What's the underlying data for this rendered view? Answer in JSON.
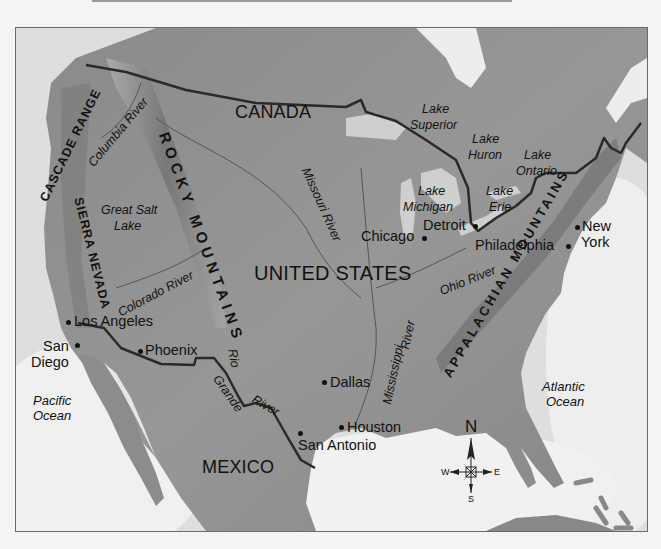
{
  "map": {
    "countries": {
      "canada": "CANADA",
      "united_states": "UNITED STATES",
      "mexico": "MEXICO"
    },
    "mountains": {
      "cascade": "CASCADE RANGE",
      "sierra": "SIERRA NEVADA",
      "rocky": "ROCKY MOUNTAINS",
      "appalachian": "APPALACHIAN MOUNTAINS"
    },
    "rivers": {
      "columbia": "Columbia River",
      "missouri": "Missouri River",
      "colorado": "Colorado River",
      "rio_grande_1": "Rio",
      "rio_grande_2": "Grande",
      "rio_grande_3": "River",
      "mississippi_1": "Mississippi",
      "mississippi_2": "River",
      "ohio": "Ohio River"
    },
    "lakes": {
      "great_salt_1": "Great Salt",
      "great_salt_2": "Lake",
      "superior_1": "Lake",
      "superior_2": "Superior",
      "huron_1": "Lake",
      "huron_2": "Huron",
      "ontario_1": "Lake",
      "ontario_2": "Ontario",
      "michigan_1": "Lake",
      "michigan_2": "Michigan",
      "erie_1": "Lake",
      "erie_2": "Erie"
    },
    "oceans": {
      "pacific_1": "Pacific",
      "pacific_2": "Ocean",
      "atlantic_1": "Atlantic",
      "atlantic_2": "Ocean"
    },
    "cities": {
      "los_angeles": "Los Angeles",
      "san_diego_1": "San",
      "san_diego_2": "Diego",
      "phoenix": "Phoenix",
      "dallas": "Dallas",
      "houston": "Houston",
      "san_antonio": "San Antonio",
      "chicago": "Chicago",
      "detroit": "Detroit",
      "philadelphia": "Philadelphia",
      "new_york_1": "New",
      "new_york_2": "York"
    },
    "compass": {
      "n": "N",
      "s": "S",
      "e": "E",
      "w": "W"
    },
    "colors": {
      "land": "#8f8f8f",
      "water": "#ececec",
      "border": "#2a2a2a",
      "text": "#111111"
    }
  }
}
